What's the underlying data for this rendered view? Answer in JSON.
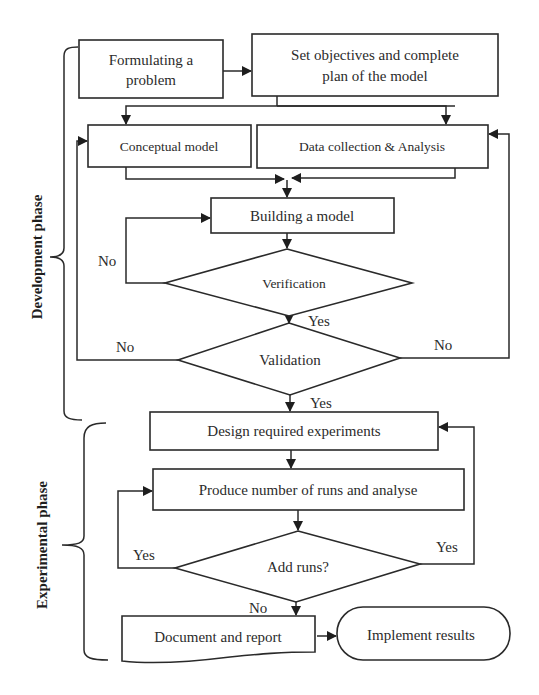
{
  "diagram": {
    "type": "flowchart",
    "phases": {
      "development": "Development phase",
      "experimental": "Experimental phase"
    },
    "nodes": {
      "formulate": {
        "line1": "Formulating a",
        "line2": "problem",
        "shape": "rectangle"
      },
      "objectives": {
        "line1": "Set objectives and complete",
        "line2": "plan of the model",
        "shape": "rectangle"
      },
      "conceptual": {
        "label": "Conceptual model",
        "shape": "rectangle"
      },
      "data_collection": {
        "label": "Data collection & Analysis",
        "shape": "rectangle"
      },
      "building": {
        "label": "Building a model",
        "shape": "rectangle"
      },
      "verification": {
        "label": "Verification",
        "shape": "diamond"
      },
      "validation": {
        "label": "Validation",
        "shape": "diamond"
      },
      "design": {
        "label": "Design required experiments",
        "shape": "rectangle"
      },
      "produce": {
        "label": "Produce number of runs and analyse",
        "shape": "rectangle"
      },
      "add_runs": {
        "label": "Add runs?",
        "shape": "diamond"
      },
      "document": {
        "label": "Document and report",
        "shape": "document"
      },
      "implement": {
        "label": "Implement results",
        "shape": "terminator"
      }
    },
    "edge_labels": {
      "verification_no": "No",
      "verification_yes": "Yes",
      "validation_no_left": "No",
      "validation_no_right": "No",
      "validation_yes": "Yes",
      "add_runs_yes_left": "Yes",
      "add_runs_yes_right": "Yes",
      "add_runs_no": "No"
    },
    "edges": [
      {
        "from": "formulate",
        "to": "objectives"
      },
      {
        "from": "objectives",
        "to": "conceptual"
      },
      {
        "from": "objectives",
        "to": "data_collection"
      },
      {
        "from": "conceptual",
        "to": "building"
      },
      {
        "from": "data_collection",
        "to": "building"
      },
      {
        "from": "building",
        "to": "verification"
      },
      {
        "from": "verification",
        "to": "building",
        "label": "No"
      },
      {
        "from": "verification",
        "to": "validation",
        "label": "Yes"
      },
      {
        "from": "validation",
        "to": "conceptual",
        "label": "No"
      },
      {
        "from": "validation",
        "to": "data_collection",
        "label": "No"
      },
      {
        "from": "validation",
        "to": "design",
        "label": "Yes"
      },
      {
        "from": "design",
        "to": "produce"
      },
      {
        "from": "produce",
        "to": "add_runs"
      },
      {
        "from": "add_runs",
        "to": "produce",
        "label": "Yes"
      },
      {
        "from": "add_runs",
        "to": "design",
        "label": "Yes"
      },
      {
        "from": "add_runs",
        "to": "document",
        "label": "No"
      },
      {
        "from": "document",
        "to": "implement"
      }
    ]
  }
}
